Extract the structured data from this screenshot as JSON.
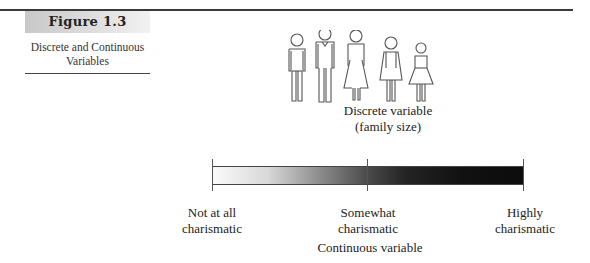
{
  "figure": {
    "label": "Figure 1.3",
    "caption_line1": "Discrete and Continuous",
    "caption_line2": "Variables"
  },
  "discrete": {
    "icon_names": [
      "man",
      "man-in-suit",
      "woman-long-dress",
      "woman-short-dress",
      "girl"
    ],
    "count": 5,
    "label_line1": "Discrete variable",
    "label_line2": "(family size)"
  },
  "continuous": {
    "gradient": {
      "start_color": "#fbfbfb",
      "end_color": "#0c0c0c"
    },
    "scale_points": [
      {
        "line1": "Not at all",
        "line2": "charismatic"
      },
      {
        "line1": "Somewhat",
        "line2": "charismatic"
      },
      {
        "line1": "Highly",
        "line2": "charismatic"
      }
    ],
    "label": "Continuous variable"
  }
}
